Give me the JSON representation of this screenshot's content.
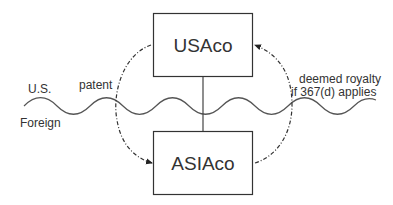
{
  "diagram": {
    "boxes": [
      {
        "id": "usaco",
        "label": "USAco"
      },
      {
        "id": "asiaco",
        "label": "ASIAco"
      }
    ],
    "regions": {
      "top": "U.S.",
      "bottom": "Foreign"
    },
    "arrows": [
      {
        "from": "usaco",
        "to": "asiaco",
        "label": "patent",
        "style": "dash-dot"
      },
      {
        "from": "asiaco",
        "to": "usaco",
        "label_lines": [
          "deemed royalty",
          "if 367(d) applies"
        ],
        "style": "dash-dot"
      }
    ],
    "colors": {
      "stroke": "#333333",
      "text": "#333333",
      "background": "#ffffff"
    }
  }
}
